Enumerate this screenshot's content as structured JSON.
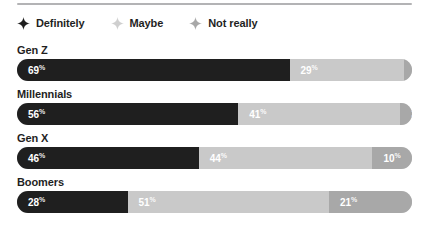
{
  "chart_data": {
    "type": "bar",
    "subtype": "stacked-horizontal-100",
    "title": "",
    "xlabel": "",
    "ylabel": "",
    "xlim": [
      0,
      100
    ],
    "grid": false,
    "legend_position": "top-left",
    "categories": [
      "Gen Z",
      "Millennials",
      "Gen X",
      "Boomers"
    ],
    "series": [
      {
        "name": "Definitely",
        "color": "#1f1f1f",
        "values": [
          69,
          56,
          46,
          28
        ]
      },
      {
        "name": "Maybe",
        "color": "#c9c9c9",
        "values": [
          29,
          41,
          44,
          51
        ]
      },
      {
        "name": "Not really",
        "color": "#a8a8a8",
        "values": [
          2,
          3,
          10,
          21
        ]
      }
    ],
    "value_suffix": "%"
  },
  "legend": {
    "items": [
      {
        "label": "Definitely",
        "icon": "sparkle-icon",
        "color": "#1f1f1f"
      },
      {
        "label": "Maybe",
        "icon": "sparkle-icon",
        "color": "#cfcfcf"
      },
      {
        "label": "Not really",
        "icon": "sparkle-icon",
        "color": "#a8a8a8"
      }
    ]
  },
  "groups": [
    {
      "label": "Gen Z",
      "segments": [
        {
          "series": "Definitely",
          "value": 69,
          "display": "69",
          "suffix": "%"
        },
        {
          "series": "Maybe",
          "value": 29,
          "display": "29",
          "suffix": "%"
        },
        {
          "series": "Not really",
          "value": 2,
          "display": "2",
          "suffix": "%"
        }
      ]
    },
    {
      "label": "Millennials",
      "segments": [
        {
          "series": "Definitely",
          "value": 56,
          "display": "56",
          "suffix": "%"
        },
        {
          "series": "Maybe",
          "value": 41,
          "display": "41",
          "suffix": "%"
        },
        {
          "series": "Not really",
          "value": 3,
          "display": "3",
          "suffix": "%"
        }
      ]
    },
    {
      "label": "Gen X",
      "segments": [
        {
          "series": "Definitely",
          "value": 46,
          "display": "46",
          "suffix": "%"
        },
        {
          "series": "Maybe",
          "value": 44,
          "display": "44",
          "suffix": "%"
        },
        {
          "series": "Not really",
          "value": 10,
          "display": "10",
          "suffix": "%"
        }
      ]
    },
    {
      "label": "Boomers",
      "segments": [
        {
          "series": "Definitely",
          "value": 28,
          "display": "28",
          "suffix": "%"
        },
        {
          "series": "Maybe",
          "value": 51,
          "display": "51",
          "suffix": "%"
        },
        {
          "series": "Not really",
          "value": 21,
          "display": "21",
          "suffix": "%"
        }
      ]
    }
  ],
  "colors": {
    "definitely": "#1f1f1f",
    "maybe": "#c9c9c9",
    "not_really": "#a8a8a8",
    "divider": "#b3b3b5",
    "text": "#1f1f1f",
    "value_text": "#ffffff",
    "background": "#ffffff"
  }
}
